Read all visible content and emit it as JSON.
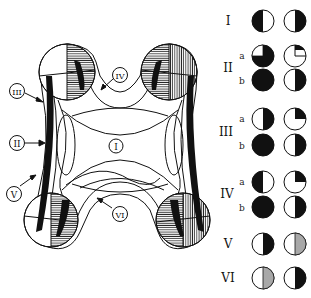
{
  "figure": {
    "diagram_labels": [
      {
        "id": "I",
        "text": "I",
        "x": 116,
        "y": 146
      },
      {
        "id": "II",
        "text": "II",
        "x": 17,
        "y": 143
      },
      {
        "id": "III",
        "text": "III",
        "x": 17,
        "y": 91
      },
      {
        "id": "IV",
        "text": "IV",
        "x": 120,
        "y": 75
      },
      {
        "id": "V",
        "text": "V",
        "x": 14,
        "y": 194
      },
      {
        "id": "VI",
        "text": "VI",
        "x": 120,
        "y": 214
      }
    ],
    "legend": {
      "rows": [
        {
          "roman": "I",
          "sub": "",
          "y": 21,
          "left": "left-half-black",
          "right": "right-half-black"
        },
        {
          "roman": "II",
          "sub": "a",
          "y": 56,
          "left": "black-white-topleft-quadrant",
          "right": "white-black-topright-small"
        },
        {
          "roman": "",
          "sub": "b",
          "y": 80,
          "left": "full-black",
          "right": "right-half-black"
        },
        {
          "roman": "III",
          "sub": "a",
          "y": 119,
          "left": "right-half-black",
          "right": "white-black-topright-quadrant"
        },
        {
          "roman": "",
          "sub": "b",
          "y": 145,
          "left": "full-black",
          "right": "right-half-black"
        },
        {
          "roman": "IV",
          "sub": "a",
          "y": 182,
          "left": "left-half-black",
          "right": "white-black-topright-quadrant"
        },
        {
          "roman": "",
          "sub": "b",
          "y": 207,
          "left": "full-black",
          "right": "right-half-black"
        },
        {
          "roman": "V",
          "sub": "",
          "y": 244,
          "left": "right-half-black",
          "right": "right-half-gray"
        },
        {
          "roman": "VI",
          "sub": "",
          "y": 278,
          "left": "right-half-gray",
          "right": "right-half-black"
        }
      ],
      "roman_labels": {
        "I": "I",
        "II": "II",
        "III": "III",
        "IV": "IV",
        "V": "V",
        "VI": "VI"
      },
      "sub_labels": {
        "a": "a",
        "b": "b"
      }
    },
    "colors": {
      "ink": "#111111",
      "gray_fill": "#a8a8a8",
      "background": "#ffffff"
    }
  }
}
